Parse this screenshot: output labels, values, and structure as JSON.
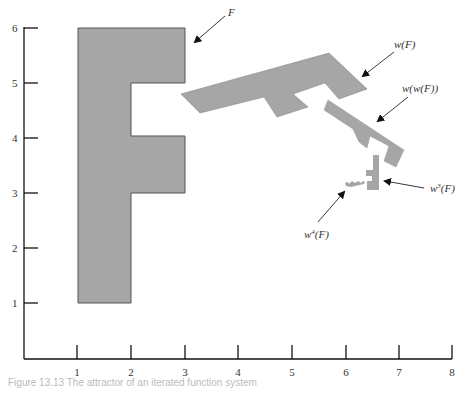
{
  "figure": {
    "caption": "Figure 13.13  The attractor of an iterated function system",
    "x_axis": {
      "ticks": [
        "1",
        "2",
        "3",
        "4",
        "5",
        "6",
        "7",
        "8"
      ]
    },
    "y_axis": {
      "ticks": [
        "1",
        "2",
        "3",
        "4",
        "5",
        "6"
      ]
    },
    "labels": {
      "F": "F",
      "wF": "w(F)",
      "wwF": "w(w(F))",
      "w3F_base": "w",
      "w3F_sup": "3",
      "w3F_rest": "(F)",
      "w4F_base": "w",
      "w4F_sup": "4",
      "w4F_rest": "(F)"
    },
    "colors": {
      "shape_fill": "#a6a6a6",
      "shape_stroke": "#555555",
      "axis": "#111111"
    }
  }
}
